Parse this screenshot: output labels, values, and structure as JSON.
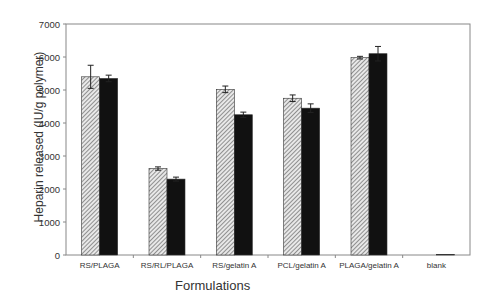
{
  "chart_data": {
    "type": "bar",
    "title": "",
    "xlabel": "Formulations",
    "ylabel": "Heparin released (IU/g polymer)",
    "ylim": [
      0,
      7000
    ],
    "yticks": [
      0,
      1000,
      2000,
      3000,
      4000,
      5000,
      6000,
      7000
    ],
    "grid": false,
    "legend": null,
    "categories": [
      "RS/PLAGA",
      "RS/RL/PLAGA",
      "RS/gelatin A",
      "PCL/gelatin A",
      "PLAGA/gelatin A",
      "blank"
    ],
    "series": [
      {
        "name": "series 1 (hatched)",
        "pattern": "hatched",
        "values": [
          5400,
          2620,
          5020,
          4750,
          5980,
          0
        ],
        "errors": [
          350,
          50,
          100,
          100,
          40,
          0
        ]
      },
      {
        "name": "series 2 (solid)",
        "pattern": "solid",
        "values": [
          5350,
          2300,
          4250,
          4450,
          6100,
          20
        ],
        "errors": [
          100,
          60,
          80,
          130,
          220,
          0
        ]
      }
    ]
  }
}
